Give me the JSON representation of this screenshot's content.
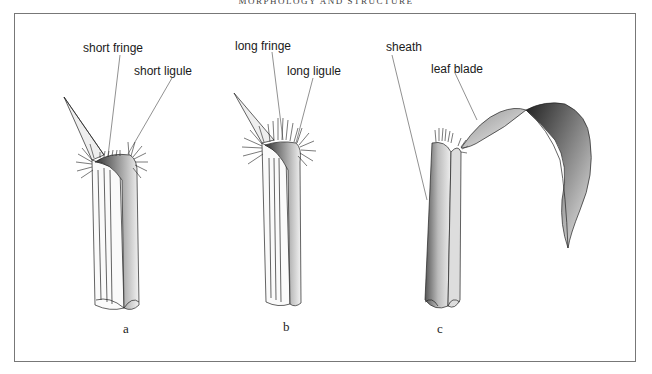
{
  "header": {
    "running_title": "MORPHOLOGY AND STRUCTURE"
  },
  "figure": {
    "panels": [
      {
        "id": "a",
        "caption": "a",
        "labels": [
          "short fringe",
          "short ligule"
        ]
      },
      {
        "id": "b",
        "caption": "b",
        "labels": [
          "long fringe",
          "long ligule"
        ]
      },
      {
        "id": "c",
        "caption": "c",
        "labels": [
          "sheath",
          "leaf blade"
        ]
      }
    ]
  },
  "colors": {
    "ink": "#1a1a1a",
    "frame": "#777777",
    "background": "#ffffff"
  }
}
